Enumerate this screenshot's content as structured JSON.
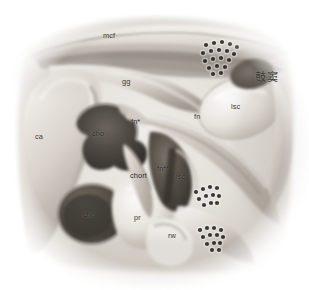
{
  "figure": {
    "kind": "anatomical-illustration",
    "width": 309,
    "height": 290,
    "background_color": "#ffffff",
    "palette": {
      "paper": "#ffffff",
      "tissue_light": "#e8e4df",
      "tissue_mid": "#c9c3bb",
      "tissue_shadow": "#8f887f",
      "cavity_dark": "#4a453f",
      "cavity_darkest": "#332f2b",
      "outline": "#6d665e",
      "air_cell_dot": "#231f1c",
      "label_text": "#2b2722"
    }
  },
  "annotations": [
    {
      "id": "mcf",
      "text": "mcf",
      "x": 103,
      "y": 32,
      "style": "light",
      "meaning": "middle cranial fossa"
    },
    {
      "id": "gg",
      "text": "gg",
      "x": 122,
      "y": 78,
      "style": "light",
      "meaning": "geniculate ganglion"
    },
    {
      "id": "antrum",
      "text": "鼓窦",
      "x": 255,
      "y": 72,
      "style": "cjk",
      "meaning": "tympanic antrum"
    },
    {
      "id": "lsc1",
      "text": "lsc",
      "x": 231,
      "y": 103,
      "style": "light",
      "meaning": "lateral semicircular canal"
    },
    {
      "id": "fn1",
      "text": "fn",
      "x": 194,
      "y": 113,
      "style": "light",
      "meaning": "facial nerve"
    },
    {
      "id": "fnstar",
      "text": "fn*",
      "x": 131,
      "y": 118,
      "style": "on-dark",
      "meaning": "facial nerve segment (starred)"
    },
    {
      "id": "ca",
      "text": "ca",
      "x": 35,
      "y": 133,
      "style": "light",
      "meaning": "cortical / canal area"
    },
    {
      "id": "cho1",
      "text": "cho",
      "x": 92,
      "y": 130,
      "style": "on-dark",
      "meaning": "cholesteatoma"
    },
    {
      "id": "fn2star",
      "text": "fn**",
      "x": 157,
      "y": 165,
      "style": "on-dark",
      "meaning": "facial nerve second genu (double-starred)"
    },
    {
      "id": "chort",
      "text": "chort",
      "x": 130,
      "y": 172,
      "style": "on-dark",
      "meaning": "chorda tympani"
    },
    {
      "id": "lsc2",
      "text": "lsc",
      "x": 176,
      "y": 173,
      "style": "on-dark",
      "meaning": "lateral semicircular canal"
    },
    {
      "id": "cho2",
      "text": "cho",
      "x": 83,
      "y": 211,
      "style": "on-dark",
      "meaning": "cholesteatoma"
    },
    {
      "id": "pr",
      "text": "pr",
      "x": 134,
      "y": 214,
      "style": "light",
      "meaning": "promontory"
    },
    {
      "id": "rw",
      "text": "rw",
      "x": 168,
      "y": 232,
      "style": "light",
      "meaning": "round window"
    }
  ],
  "air_cell_clusters": [
    {
      "id": "cluster-superior",
      "label": "mastoid air cells superior",
      "dots": [
        [
          206,
          45
        ],
        [
          214,
          43
        ],
        [
          222,
          42
        ],
        [
          230,
          44
        ],
        [
          237,
          47
        ],
        [
          203,
          53
        ],
        [
          211,
          51
        ],
        [
          219,
          50
        ],
        [
          227,
          51
        ],
        [
          234,
          54
        ],
        [
          205,
          61
        ],
        [
          213,
          59
        ],
        [
          221,
          58
        ],
        [
          229,
          60
        ],
        [
          209,
          68
        ],
        [
          217,
          66
        ],
        [
          225,
          67
        ],
        [
          213,
          74
        ],
        [
          221,
          73
        ]
      ]
    },
    {
      "id": "cluster-middle",
      "label": "mastoid air cells middle",
      "dots": [
        [
          196,
          192
        ],
        [
          203,
          189
        ],
        [
          210,
          187
        ],
        [
          217,
          188
        ],
        [
          199,
          199
        ],
        [
          206,
          196
        ],
        [
          213,
          195
        ],
        [
          219,
          196
        ],
        [
          204,
          205
        ],
        [
          211,
          203
        ],
        [
          217,
          203
        ]
      ]
    },
    {
      "id": "cluster-inferior",
      "label": "mastoid air cells inferior",
      "dots": [
        [
          200,
          230
        ],
        [
          207,
          228
        ],
        [
          214,
          228
        ],
        [
          221,
          230
        ],
        [
          203,
          237
        ],
        [
          210,
          235
        ],
        [
          217,
          235
        ],
        [
          223,
          237
        ],
        [
          207,
          244
        ],
        [
          214,
          243
        ],
        [
          220,
          243
        ],
        [
          212,
          250
        ],
        [
          219,
          250
        ]
      ]
    }
  ]
}
